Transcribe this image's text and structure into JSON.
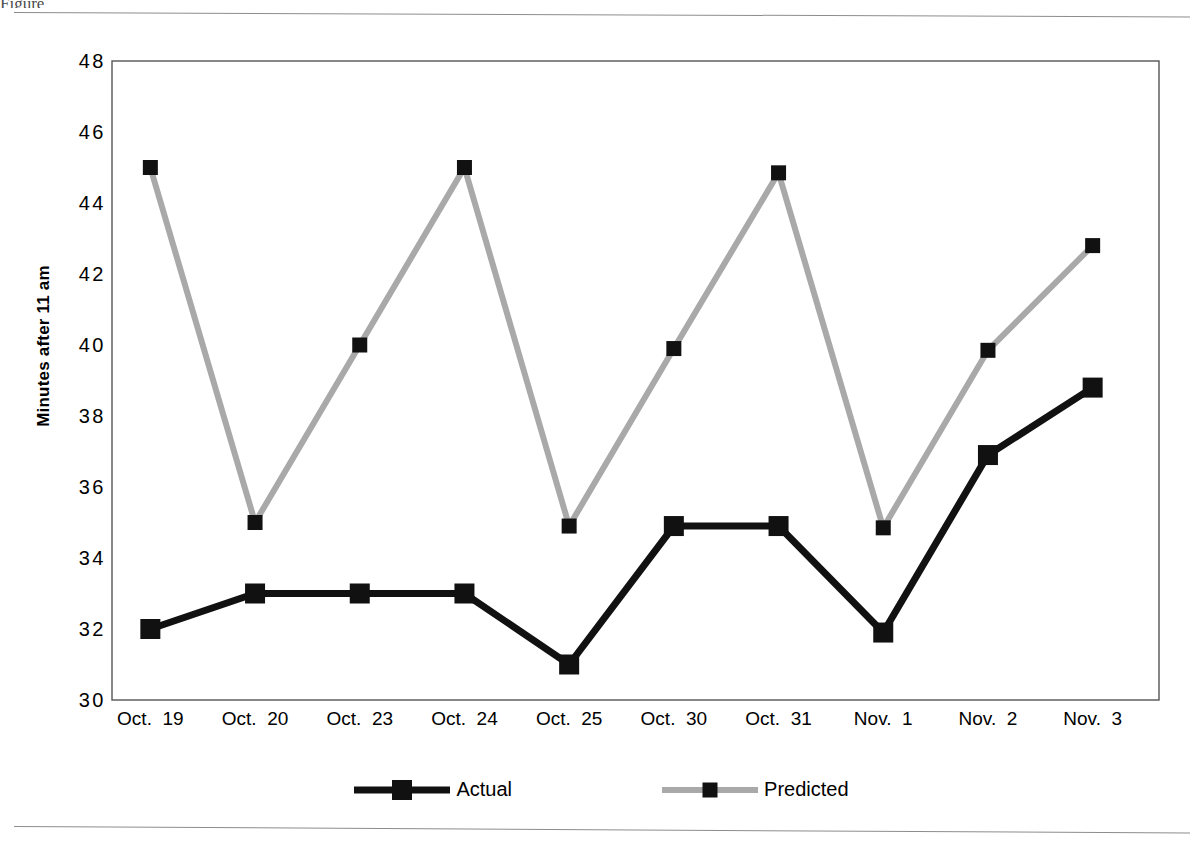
{
  "figure": {
    "y_axis_title": "Minutes after 11 am",
    "partial_caption_above": "Figure"
  },
  "legend": {
    "position": "bottom-center",
    "entries": [
      {
        "label": "Actual",
        "color": "#111111",
        "marker": "square"
      },
      {
        "label": "Predicted",
        "color": "#a9a9a9",
        "marker": "square"
      }
    ]
  },
  "chart_data": {
    "type": "line",
    "title": "",
    "xlabel": "",
    "ylabel": "Minutes after 11 am",
    "ylim": [
      30,
      48
    ],
    "yticks": [
      30,
      32,
      34,
      36,
      38,
      40,
      42,
      44,
      46,
      48
    ],
    "ytick_labels": [
      "30",
      "32",
      "34",
      "36",
      "38",
      "40",
      "42",
      "44",
      "46",
      "48"
    ],
    "grid": false,
    "legend_position": "bottom",
    "categories": [
      "Oct. 19",
      "Oct. 20",
      "Oct. 23",
      "Oct. 24",
      "Oct. 25",
      "Oct. 30",
      "Oct. 31",
      "Nov. 1",
      "Nov. 2",
      "Nov. 3"
    ],
    "series": [
      {
        "name": "Actual",
        "color": "#111111",
        "line_width": 7,
        "marker_size": 20,
        "values": [
          32.0,
          33.0,
          33.0,
          33.0,
          31.0,
          34.9,
          34.9,
          31.9,
          36.9,
          38.8
        ]
      },
      {
        "name": "Predicted",
        "color": "#a9a9a9",
        "line_width": 6,
        "marker_size": 15,
        "values": [
          45.0,
          35.0,
          40.0,
          45.0,
          34.9,
          39.9,
          44.85,
          34.85,
          39.85,
          42.8
        ]
      }
    ]
  }
}
